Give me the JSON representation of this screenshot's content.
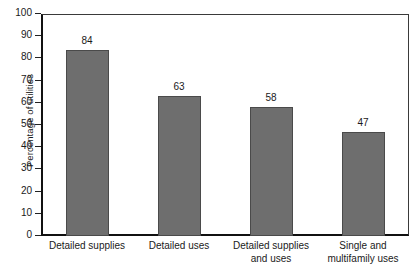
{
  "chart_data": {
    "type": "bar",
    "title": "",
    "xlabel": "",
    "ylabel": "Percentage of utilities",
    "ylim": [
      0,
      100
    ],
    "ytick_step": 10,
    "grid": false,
    "legend": false,
    "bar_color": "#6e6e6e",
    "categories": [
      "Detailed supplies",
      "Detailed uses",
      "Detailed supplies and uses",
      "Single and multifamily uses"
    ],
    "category_lines": [
      [
        "Detailed supplies"
      ],
      [
        "Detailed uses"
      ],
      [
        "Detailed supplies",
        "and uses"
      ],
      [
        "Single and",
        "multifamily uses"
      ]
    ],
    "values": [
      84,
      63,
      58,
      47
    ],
    "value_labels": [
      "84",
      "63",
      "58",
      "47"
    ],
    "yticks": [
      "0",
      "10",
      "20",
      "30",
      "40",
      "50",
      "60",
      "70",
      "80",
      "90",
      "100"
    ]
  }
}
